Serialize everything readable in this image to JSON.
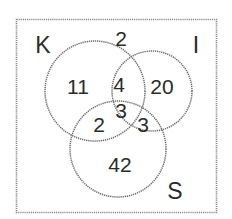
{
  "diagram": {
    "type": "venn-3-set",
    "universe": {
      "name": "universal-set-rectangle",
      "outside_count": "2"
    },
    "sets": [
      {
        "key": "K",
        "label": "K",
        "label_position": "top-left"
      },
      {
        "key": "I",
        "label": "I",
        "label_position": "top-right"
      },
      {
        "key": "S",
        "label": "S",
        "label_position": "bottom-right"
      }
    ],
    "regions": [
      {
        "id": "K-only",
        "label": "11",
        "description": "K only"
      },
      {
        "id": "I-only",
        "label": "20",
        "description": "I only"
      },
      {
        "id": "S-only",
        "label": "42",
        "description": "S only"
      },
      {
        "id": "K-and-I",
        "label": "4",
        "description": "K and I only"
      },
      {
        "id": "K-and-S",
        "label": "2",
        "description": "K and S only"
      },
      {
        "id": "I-and-S",
        "label": "3",
        "description": "I and S only"
      },
      {
        "id": "K-I-S",
        "label": "3",
        "description": "K and I and S"
      },
      {
        "id": "outside",
        "label": "2",
        "description": "Outside all sets"
      }
    ],
    "colors": {
      "background": "#ffffff",
      "stroke": "#6f6f6f",
      "rect_stroke": "#8a8a8a",
      "text": "#2b2b2b"
    }
  }
}
